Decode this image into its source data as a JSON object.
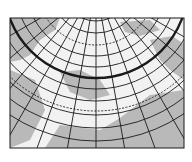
{
  "map": {
    "projection": "polar azimuthal graticule",
    "frame": {
      "x": 10,
      "y": 18,
      "width": 174,
      "height": 130
    },
    "pole": {
      "x": 96,
      "y": -14
    },
    "colors": {
      "background": "#ffffff",
      "ocean": "#f2f2f2",
      "land": "#b9b9b9",
      "grid": "#1a1a1a"
    },
    "parallels": [
      {
        "r": 35,
        "style": "solid"
      },
      {
        "r": 47,
        "style": "solid"
      },
      {
        "r": 59,
        "style": "dashed"
      },
      {
        "r": 70,
        "style": "solid"
      },
      {
        "r": 81,
        "style": "solid"
      },
      {
        "r": 92,
        "style": "thick"
      },
      {
        "r": 103,
        "style": "solid"
      },
      {
        "r": 115,
        "style": "solid"
      },
      {
        "r": 125,
        "style": "dashed"
      },
      {
        "r": 129,
        "style": "solid"
      },
      {
        "r": 142,
        "style": "solid"
      },
      {
        "r": 155,
        "style": "solid"
      }
    ],
    "meridian_step_deg": 10,
    "meridian_range_deg": [
      -60,
      60
    ]
  }
}
